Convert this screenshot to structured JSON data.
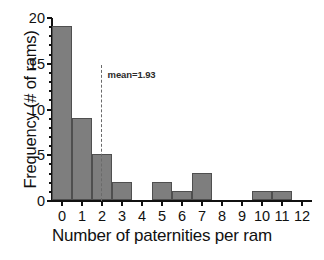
{
  "chart_data": {
    "type": "bar",
    "title": "",
    "xlabel": "Number of paternities per ram",
    "ylabel": "Frequency (# of rams)",
    "categories": [
      "0",
      "1",
      "2",
      "3",
      "4",
      "5",
      "6",
      "7",
      "8",
      "9",
      "10",
      "11",
      "12"
    ],
    "values": [
      19,
      9,
      5,
      2,
      0,
      2,
      1,
      3,
      0,
      0,
      1,
      1,
      0
    ],
    "xlim": [
      -0.5,
      12.5
    ],
    "ylim": [
      0,
      20
    ],
    "yticks": [
      0,
      5,
      10,
      15,
      20
    ],
    "yticks_minor": [
      1,
      2,
      3,
      4,
      6,
      7,
      8,
      9,
      11,
      12,
      13,
      14,
      16,
      17,
      18,
      19
    ],
    "xticks": [
      0,
      1,
      2,
      3,
      4,
      5,
      6,
      7,
      8,
      9,
      10,
      11,
      12
    ],
    "grid": false,
    "legend": null,
    "bar_color": "#7e7e7e",
    "bar_edge_color": "#4f4f4f",
    "axis_color": "#111111",
    "annotations": [
      {
        "name": "mean-line",
        "label": "mean=1.93",
        "value": 1.93,
        "orientation": "vertical",
        "style": "dashed",
        "color": "#6a6a6a"
      }
    ]
  }
}
